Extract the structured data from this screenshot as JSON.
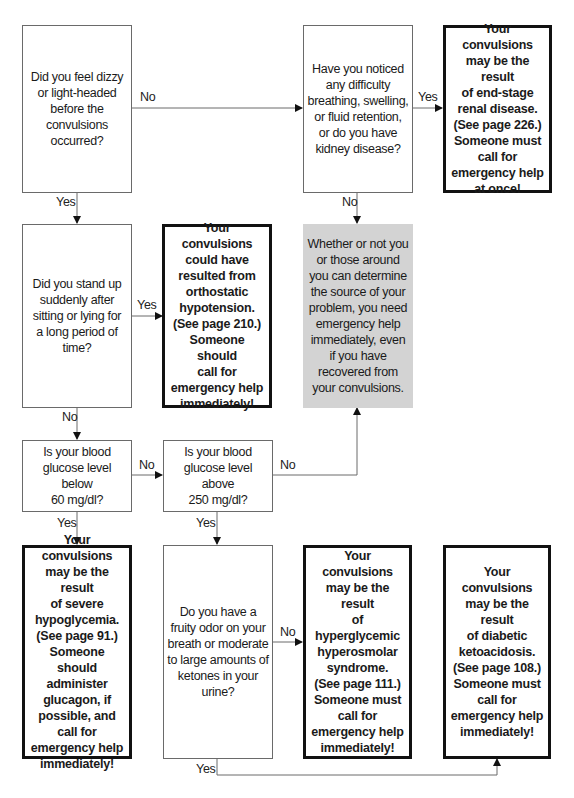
{
  "questions": {
    "dizzy": "Did you feel dizzy\nor light-headed\nbefore the\nconvulsions\noccurred?",
    "kidney": "Have you noticed\nany difficulty\nbreathing, swelling,\nor fluid retention,\nor do you have\nkidney disease?",
    "stand_up": "Did you stand up\nsuddenly after\nsitting or lying for\na long period of\ntime?",
    "glucose_below": "Is your blood\nglucose level below\n60 mg/dl?",
    "glucose_above": "Is your blood\nglucose level above\n250 mg/dl?",
    "fruity_odor": "Do you have a\nfruity odor on your\nbreath or moderate\nto large amounts of\nketones in your\nurine?"
  },
  "outcomes": {
    "renal": "Your convulsions\nmay be the result\nof end-stage\nrenal disease.\n(See page 226.)\nSomeone must\ncall for\nemergency help\nat once!",
    "orthostatic": "Your convulsions\ncould have\nresulted from\northostatic\nhypotension.\n(See page 210.)\nSomeone should\ncall for\nemergency help\nimmediately!",
    "hypoglycemia": "Your convulsions\nmay be the result\nof severe\nhypoglycemia.\n(See page 91.)\nSomeone should\nadminister\nglucagon, if\npossible, and\ncall for\nemergency help\nimmediately!",
    "hyperosmolar": "Your convulsions\nmay be the result\nof hyperglycemic\nhyperosmolar\nsyndrome.\n(See page 111.)\nSomeone must\ncall for\nemergency help\nimmediately!",
    "ketoacidosis": "Your convulsions\nmay be the result\nof diabetic\nketoacidosis.\n(See page 108.)\nSomeone must\ncall for\nemergency help\nimmediately!"
  },
  "emergency_note": "Whether or not you\nor those around\nyou can determine\nthe source of your\nproblem, you need\nemergency help\nimmediately, even\nif you have\nrecovered from\nyour convulsions.",
  "labels": {
    "dizzy_no": "No",
    "dizzy_yes": "Yes",
    "kidney_yes": "Yes",
    "kidney_no": "No",
    "stand_yes": "Yes",
    "stand_no": "No",
    "below_no": "No",
    "below_yes": "Yes",
    "above_no": "No",
    "above_yes": "Yes",
    "fruity_no": "No",
    "fruity_yes": "Yes"
  },
  "colors": {
    "emergency_fill": "#d3d3d3",
    "outcome_border": "#111111",
    "question_border": "#6a6a6a"
  }
}
